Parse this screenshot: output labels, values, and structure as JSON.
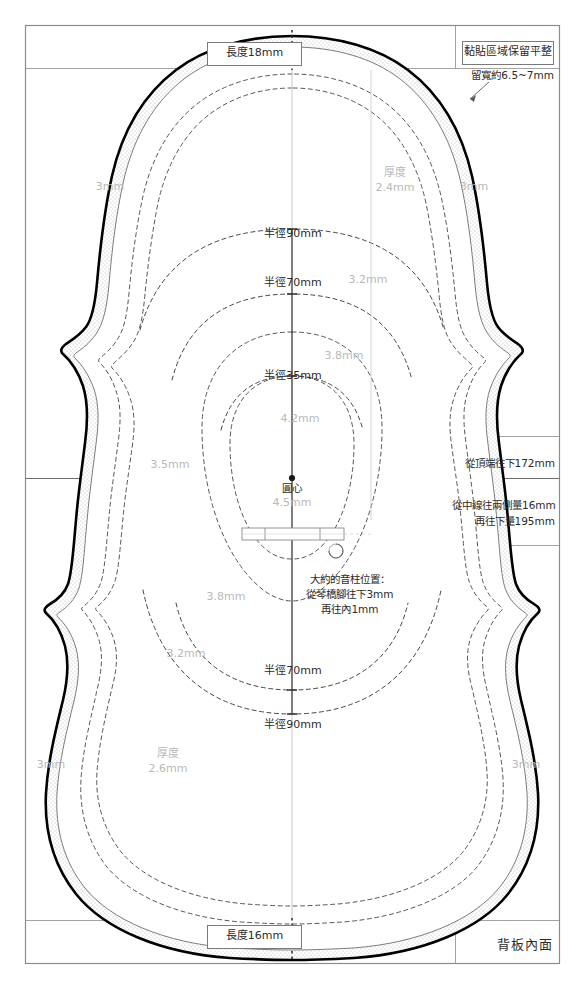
{
  "document": {
    "title": "背板內面",
    "sheet_w": 585,
    "sheet_h": 989
  },
  "boxes": {
    "top_length": "長度18mm",
    "bottom_length": "長度16mm",
    "glue_flat": "黏貼區域保留平整"
  },
  "annotations": {
    "glue_width": "留寬約6.5~7mm",
    "from_top_172": "從頂端往下172mm",
    "from_center_16": "從中線往兩側量16mm",
    "then_down_195": "再往下量195mm",
    "soundpost_line1": "大約的音柱位置：",
    "soundpost_line2": "從琴橋腳往下3mm",
    "soundpost_line3": "再往內1mm",
    "center_point": "圓心"
  },
  "radii": {
    "upper_90": "半徑90mm",
    "upper_70": "半徑70mm",
    "upper_35": "半徑35mm",
    "lower_70": "半徑70mm",
    "lower_90": "半徑90mm"
  },
  "thickness": {
    "edge_top_left": "3mm",
    "edge_top_right": "3mm",
    "edge_mid_left": "3.5mm",
    "edge_bottom_left": "3mm",
    "edge_bottom_right": "3mm",
    "top_label": "厚度",
    "top_value": "2.4mm",
    "bottom_label": "厚度",
    "bottom_value": "2.6mm",
    "upper_32": "3.2mm",
    "upper_38": "3.8mm",
    "upper_42": "4.2mm",
    "center_45": "4.5mm",
    "lower_38": "3.8mm",
    "lower_32": "3.2mm"
  },
  "colors": {
    "outline": "#000000",
    "inner_line": "#6e6e6e",
    "contour": "#555555",
    "frame": "#8c8c8c",
    "gray_text": "#b9b9b9",
    "black_text": "#2b2b2b",
    "stipple": "#cfcfcf"
  }
}
